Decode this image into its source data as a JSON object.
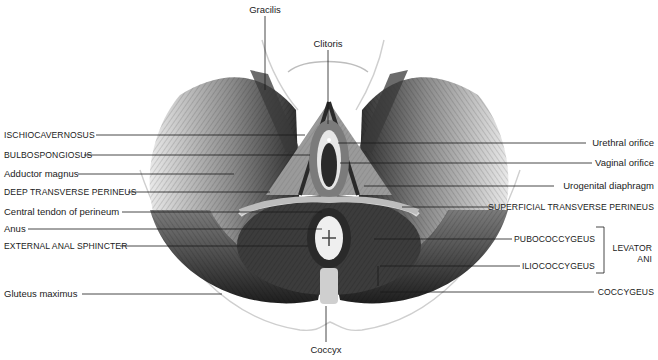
{
  "figure": {
    "colors": {
      "background": "#ffffff",
      "ink": "#1a1a1a",
      "muscle_dark": "#2a2a2a",
      "muscle_mid": "#6b6b6b",
      "muscle_light": "#cfcfcf",
      "skin_outline": "#c8c8c8"
    }
  },
  "labels": {
    "top": [
      {
        "id": "gracilis",
        "text": "Gracilis",
        "x": 265,
        "y": 4
      },
      {
        "id": "clitoris",
        "text": "Clitoris",
        "x": 328,
        "y": 38
      }
    ],
    "bottom": [
      {
        "id": "coccyx",
        "text": "Coccyx",
        "x": 326,
        "y": 344
      }
    ],
    "left": [
      {
        "id": "ischiocavernosus",
        "text": "ISCHIOCAVERNOSUS",
        "caps": true,
        "y": 129
      },
      {
        "id": "bulbospongiosus",
        "text": "BULBOSPONGIOSUS",
        "caps": true,
        "y": 149
      },
      {
        "id": "adductor-magnus",
        "text": "Adductor magnus",
        "caps": false,
        "y": 168
      },
      {
        "id": "deep-transverse-perineus",
        "text": "DEEP TRANSVERSE PERINEUS",
        "caps": true,
        "y": 186
      },
      {
        "id": "central-tendon",
        "text": "Central tendon of perineum",
        "caps": false,
        "y": 206
      },
      {
        "id": "anus",
        "text": "Anus",
        "caps": false,
        "y": 223
      },
      {
        "id": "external-anal-sphincter",
        "text": "EXTERNAL ANAL SPHINCTER",
        "caps": true,
        "y": 240
      },
      {
        "id": "gluteus-maximus",
        "text": "Gluteus maximus",
        "caps": false,
        "y": 288
      }
    ],
    "right": [
      {
        "id": "urethral-orifice",
        "text": "Urethral orifice",
        "caps": false,
        "y": 137
      },
      {
        "id": "vaginal-orifice",
        "text": "Vaginal orifice",
        "caps": false,
        "y": 157
      },
      {
        "id": "urogenital-diaphragm",
        "text": "Urogenital diaphragm",
        "caps": false,
        "y": 180
      },
      {
        "id": "superficial-transverse-perineus",
        "text": "SUPERFICIAL TRANSVERSE PERINEUS",
        "caps": true,
        "y": 201
      },
      {
        "id": "pubococcygeus",
        "text": "PUBOCOCCYGEUS",
        "caps": true,
        "y": 233
      },
      {
        "id": "iliococcygeus",
        "text": "ILIOCOCCYGEUS",
        "caps": true,
        "y": 260
      },
      {
        "id": "coccygeus",
        "text": "COCCYGEUS",
        "caps": true,
        "y": 286
      }
    ],
    "group": {
      "id": "levator-ani",
      "line1": "LEVATOR",
      "line2": "ANI"
    }
  }
}
